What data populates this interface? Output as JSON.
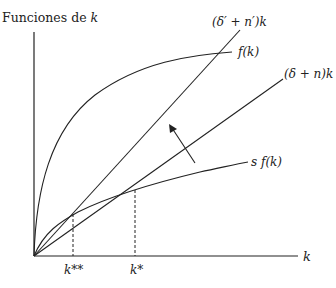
{
  "diagram": {
    "y_axis_label": "Funciones de k",
    "y_axis_label_prefix": "Funciones de ",
    "y_axis_label_var": "k",
    "x_axis_label": "k",
    "curves": {
      "f": "f(k)",
      "sf": "s f(k)",
      "line_new": "(δ′ + n′)k",
      "line_old": "(δ + n)k"
    },
    "x_ticks": {
      "k_double_star": "k**",
      "k_star": "k*"
    },
    "colors": {
      "line": "#222222",
      "background": "#ffffff"
    }
  }
}
